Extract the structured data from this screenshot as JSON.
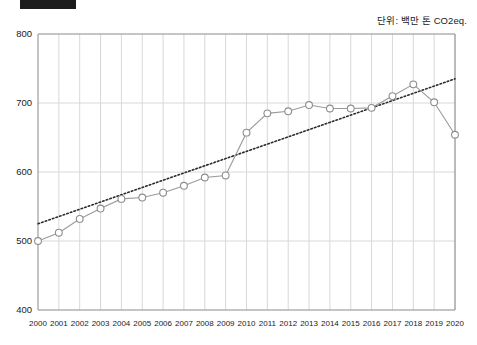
{
  "header": {
    "redaction_bar": "redacted-block",
    "unit_label": "단위: 백만 톤 CO2eq."
  },
  "colors": {
    "line": "#9a9a9a",
    "marker_stroke": "#8d8d8d",
    "marker_fill": "#ffffff",
    "trendline": "#2b2b2b",
    "grid": "#d8d8d8",
    "axis": "#8a8a8a",
    "text": "#1a1a1a",
    "redaction": "#1c1c1c"
  },
  "chart_data": {
    "type": "line",
    "title": "",
    "subtitle": "",
    "xlabel": "",
    "ylabel": "",
    "unit": "단위: 백만 톤 CO2eq.",
    "ylim": [
      400,
      800
    ],
    "yticks": [
      400,
      500,
      600,
      700,
      800
    ],
    "grid": true,
    "legend_position": "none",
    "categories": [
      "2000",
      "2001",
      "2002",
      "2003",
      "2004",
      "2005",
      "2006",
      "2007",
      "2008",
      "2009",
      "2010",
      "2011",
      "2012",
      "2013",
      "2014",
      "2015",
      "2016",
      "2017",
      "2018",
      "2019",
      "2020"
    ],
    "series": [
      {
        "name": "총배출량",
        "marker": "circle-open",
        "values": [
          500,
          512,
          532,
          547,
          561,
          563,
          570,
          580,
          592,
          595,
          657,
          685,
          688,
          697,
          692,
          692,
          693,
          710,
          727,
          701,
          654
        ]
      },
      {
        "name": "추세선",
        "style": "dotted",
        "type": "trend",
        "endpoints": [
          525,
          735
        ]
      }
    ],
    "annotations": []
  }
}
